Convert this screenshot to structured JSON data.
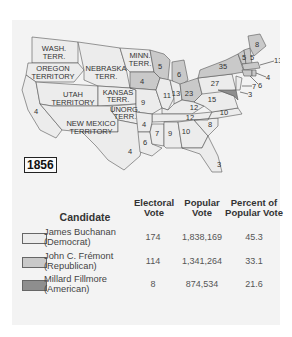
{
  "year": "1856",
  "colors": {
    "panel_bg": "#f3f3f3",
    "democrat": "#ececec",
    "republican": "#c9c9c9",
    "american": "#8e8e8e",
    "border": "#555555"
  },
  "map": {
    "territories": [
      {
        "name": "WASH. TERR.",
        "lines": [
          "WASH.",
          "TERR."
        ]
      },
      {
        "name": "OREGON TERRITORY",
        "lines": [
          "OREGON",
          "TERRITORY"
        ]
      },
      {
        "name": "NEBRASKA TERR.",
        "lines": [
          "NEBRASKA",
          "TERR."
        ]
      },
      {
        "name": "MINN. TERR.",
        "lines": [
          "MINN.",
          "TERR."
        ]
      },
      {
        "name": "UTAH TERRITORY",
        "lines": [
          "UTAH",
          "TERRITORY"
        ]
      },
      {
        "name": "KANSAS TERR.",
        "lines": [
          "KANSAS",
          "TERR."
        ]
      },
      {
        "name": "UNORG. TERR.",
        "lines": [
          "UNORG.",
          "TERR."
        ]
      },
      {
        "name": "NEW MEXICO TERRITORY",
        "lines": [
          "NEW MEXICO",
          "TERRITORY"
        ]
      }
    ],
    "state_votes": [
      {
        "state": "California",
        "votes": "4",
        "party": "democrat"
      },
      {
        "state": "Texas",
        "votes": "4",
        "party": "democrat"
      },
      {
        "state": "Iowa",
        "votes": "4",
        "party": "republican"
      },
      {
        "state": "Wisconsin",
        "votes": "5",
        "party": "republican"
      },
      {
        "state": "Michigan",
        "votes": "6",
        "party": "republican"
      },
      {
        "state": "Ohio",
        "votes": "23",
        "party": "republican"
      },
      {
        "state": "New York",
        "votes": "35",
        "party": "republican"
      },
      {
        "state": "Maine",
        "votes": "8",
        "party": "republican"
      },
      {
        "state": "Vermont",
        "votes": "5",
        "party": "republican"
      },
      {
        "state": "New Hampshire",
        "votes": "5",
        "party": "republican"
      },
      {
        "state": "Massachusetts",
        "votes": "13",
        "party": "republican"
      },
      {
        "state": "Rhode Island",
        "votes": "4",
        "party": "republican"
      },
      {
        "state": "Connecticut",
        "votes": "6",
        "party": "republican"
      },
      {
        "state": "New Jersey",
        "votes": "7",
        "party": "democrat"
      },
      {
        "state": "Delaware",
        "votes": "3",
        "party": "democrat"
      },
      {
        "state": "Maryland",
        "votes": "8",
        "party": "american"
      },
      {
        "state": "Pennsylvania",
        "votes": "27",
        "party": "democrat"
      },
      {
        "state": "Illinois",
        "votes": "11",
        "party": "democrat"
      },
      {
        "state": "Indiana",
        "votes": "13",
        "party": "democrat"
      },
      {
        "state": "Missouri",
        "votes": "9",
        "party": "democrat"
      },
      {
        "state": "Kentucky",
        "votes": "12",
        "party": "democrat"
      },
      {
        "state": "Virginia",
        "votes": "15",
        "party": "democrat"
      },
      {
        "state": "Tennessee",
        "votes": "12",
        "party": "democrat"
      },
      {
        "state": "North Carolina",
        "votes": "10",
        "party": "democrat"
      },
      {
        "state": "Arkansas",
        "votes": "4",
        "party": "democrat"
      },
      {
        "state": "Louisiana",
        "votes": "6",
        "party": "democrat"
      },
      {
        "state": "Mississippi",
        "votes": "7",
        "party": "democrat"
      },
      {
        "state": "Alabama",
        "votes": "9",
        "party": "democrat"
      },
      {
        "state": "Georgia",
        "votes": "10",
        "party": "democrat"
      },
      {
        "state": "South Carolina",
        "votes": "8",
        "party": "democrat"
      },
      {
        "state": "Florida",
        "votes": "3",
        "party": "democrat"
      }
    ]
  },
  "legend": {
    "headers": {
      "candidate": "Candidate",
      "electoral": [
        "Electoral",
        "Vote"
      ],
      "popular": [
        "Popular",
        "Vote"
      ],
      "percent": [
        "Percent of",
        "Popular Vote"
      ]
    },
    "rows": [
      {
        "name": "James Buchanan",
        "party": "(Democrat)",
        "electoral": "174",
        "popular": "1,838,169",
        "percent": "45.3"
      },
      {
        "name": "John C. Frémont",
        "party": "(Republican)",
        "electoral": "114",
        "popular": "1,341,264",
        "percent": "33.1"
      },
      {
        "name": "Millard Fillmore",
        "party": "(American)",
        "electoral": "8",
        "popular": "874,534",
        "percent": "21.6"
      }
    ]
  }
}
